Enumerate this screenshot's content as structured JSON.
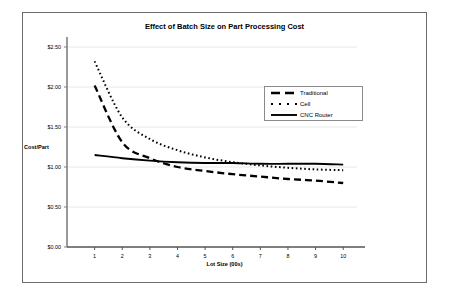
{
  "chart_data": {
    "type": "line",
    "title": "Effect of Batch Size on Part Processing Cost",
    "xlabel": "Lot Size (00s)",
    "ylabel": "Cost/Part",
    "x": [
      1,
      2,
      3,
      4,
      5,
      6,
      7,
      8,
      9,
      10
    ],
    "xlim": [
      0,
      10.5
    ],
    "ylim": [
      0.0,
      2.5
    ],
    "xticklabels": [
      "1",
      "2",
      "3",
      "4",
      "5",
      "6",
      "7",
      "8",
      "9",
      "10"
    ],
    "yticklabels": [
      "$0.00",
      "$0.50",
      "$1.00",
      "$1.50",
      "$2.00",
      "$2.50"
    ],
    "ytickvalues": [
      0.0,
      0.5,
      1.0,
      1.5,
      2.0,
      2.5
    ],
    "grid": "horizontal",
    "legend_position": "upper right",
    "series": [
      {
        "name": "Traditional",
        "style": "dashed",
        "values": [
          2.02,
          1.31,
          1.11,
          1.0,
          0.95,
          0.91,
          0.88,
          0.85,
          0.83,
          0.8
        ]
      },
      {
        "name": "Cell",
        "style": "dotted",
        "values": [
          2.32,
          1.62,
          1.35,
          1.21,
          1.12,
          1.06,
          1.02,
          0.99,
          0.97,
          0.96
        ]
      },
      {
        "name": "CNC Router",
        "style": "solid",
        "values": [
          1.15,
          1.11,
          1.08,
          1.06,
          1.05,
          1.05,
          1.04,
          1.04,
          1.04,
          1.03
        ]
      }
    ]
  },
  "legend": {
    "entries": [
      {
        "label": "Traditional"
      },
      {
        "label": "Cell"
      },
      {
        "label": "CNC Router"
      }
    ]
  },
  "colors": {
    "line": "#000000",
    "grid": "#e8e8e8",
    "axis": "#808080",
    "border": "#6b6b6b"
  }
}
